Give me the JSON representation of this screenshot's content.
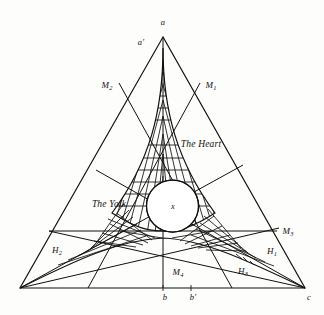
{
  "figure": {
    "type": "geometry-diagram",
    "vertices": {
      "apex": {
        "label": "a",
        "x": 163,
        "y": 22
      },
      "bottom_left": {
        "label": "",
        "x": 20,
        "y": 288
      },
      "bottom_right": {
        "label": "c",
        "x": 309,
        "y": 296
      }
    },
    "labels": [
      {
        "name": "vertex-a",
        "text": "a",
        "x": 163,
        "y": 22,
        "size": "sm"
      },
      {
        "name": "point-a-prime",
        "text": "a′",
        "x": 141,
        "y": 42,
        "size": "sm"
      },
      {
        "name": "point-m2",
        "text": "M",
        "sub": "2",
        "x": 107,
        "y": 86,
        "size": "md"
      },
      {
        "name": "point-m1",
        "text": "M",
        "sub": "1",
        "x": 211,
        "y": 86,
        "size": "md"
      },
      {
        "name": "region-heart",
        "text": "The Heart",
        "x": 201,
        "y": 145,
        "size": "phrase"
      },
      {
        "name": "region-yolk",
        "text": "The Yolk",
        "x": 109,
        "y": 205,
        "size": "phrase"
      },
      {
        "name": "point-x",
        "text": "x",
        "x": 173,
        "y": 206,
        "size": "sm"
      },
      {
        "name": "point-m3",
        "text": "M",
        "sub": "3",
        "x": 288,
        "y": 232,
        "size": "md"
      },
      {
        "name": "point-h2",
        "text": "H",
        "sub": "2",
        "x": 57,
        "y": 251,
        "size": "md"
      },
      {
        "name": "point-h1",
        "text": "H",
        "sub": "1",
        "x": 272,
        "y": 252,
        "size": "md"
      },
      {
        "name": "point-h3",
        "text": "H",
        "sub": "3",
        "x": 243,
        "y": 272,
        "size": "md"
      },
      {
        "name": "point-m4",
        "text": "M",
        "sub": "4",
        "x": 178,
        "y": 273,
        "size": "md"
      },
      {
        "name": "point-b",
        "text": "b",
        "x": 165,
        "y": 297,
        "size": "sm"
      },
      {
        "name": "point-b-prime",
        "text": "b′",
        "x": 193,
        "y": 297,
        "size": "sm"
      },
      {
        "name": "vertex-c",
        "text": "c",
        "x": 309,
        "y": 297,
        "size": "sm"
      }
    ],
    "colors": {
      "ink": "#111111",
      "paper": "#fdfdfc"
    },
    "incircle": {
      "cx": 172.5,
      "cy": 206,
      "r": 26
    },
    "baseline_y": 288,
    "horizontal_line_y": 231
  }
}
